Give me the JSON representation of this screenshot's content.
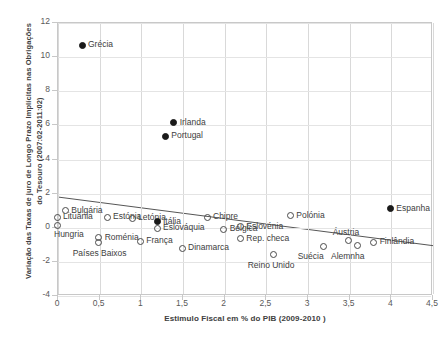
{
  "axes": {
    "y_title": "Variação das Taxas de juro de Longo Prazo Implícitas nas Obrigações do Tesouro  (2007:02-2011:02)",
    "x_title": "Estimulo Fiscal em % do PIB (2009-2010 )",
    "y_ticks": [
      "12",
      "10",
      "8",
      "6",
      "4",
      "2",
      "0",
      "-2",
      "-4"
    ],
    "x_ticks": [
      "0",
      "0,5",
      "1",
      "1,5",
      "2",
      "2,5",
      "3",
      "3,5",
      "4",
      "4,5"
    ]
  },
  "chart_data": {
    "type": "scatter",
    "title": "",
    "xlabel": "Estimulo Fiscal em % do PIB (2009-2010 )",
    "ylabel": "Variação das Taxas de juro de Longo Prazo Implícitas nas Obrigações do Tesouro  (2007:02-2011:02)",
    "xlim": [
      0,
      4.5
    ],
    "ylim": [
      -4,
      12
    ],
    "xtick_values": [
      0,
      0.5,
      1,
      1.5,
      2,
      2.5,
      3,
      3.5,
      4,
      4.5
    ],
    "ytick_values": [
      12,
      10,
      8,
      6,
      4,
      2,
      0,
      -2,
      -4
    ],
    "grid": "both",
    "legend": "none",
    "marker_styles": {
      "hollow": "outlined circle — non-programme countries",
      "filled": "solid black circle — bailout / stressed countries"
    },
    "trendline": {
      "visible": true,
      "x0": 0.0,
      "y0": 1.8,
      "x1": 4.5,
      "y1": -1.05
    },
    "points": [
      {
        "label": "Grécia",
        "x": 0.3,
        "y": 10.65,
        "style": "filled",
        "label_pos": "right"
      },
      {
        "label": "Irlanda",
        "x": 1.4,
        "y": 6.1,
        "style": "filled",
        "label_pos": "right"
      },
      {
        "label": "Portugal",
        "x": 1.3,
        "y": 5.3,
        "style": "filled",
        "label_pos": "right"
      },
      {
        "label": "Espanha",
        "x": 4.0,
        "y": 1.05,
        "style": "filled",
        "label_pos": "right"
      },
      {
        "label": "Lituânia",
        "x": 0.0,
        "y": 0.55,
        "style": "hollow",
        "label_pos": "right"
      },
      {
        "label": "Bulgária",
        "x": 0.1,
        "y": 0.95,
        "style": "hollow",
        "label_pos": "right"
      },
      {
        "label": "Hungria",
        "x": 0.0,
        "y": 0.1,
        "style": "hollow",
        "label_pos": "below-left"
      },
      {
        "label": "Estónia",
        "x": 0.6,
        "y": 0.55,
        "style": "hollow",
        "label_pos": "right"
      },
      {
        "label": "Roménia",
        "x": 0.5,
        "y": -0.65,
        "style": "hollow",
        "label_pos": "right"
      },
      {
        "label": "Países Baixos",
        "x": 0.5,
        "y": -0.95,
        "style": "hollow",
        "label_pos": "below"
      },
      {
        "label": "Letónia",
        "x": 0.9,
        "y": 0.5,
        "style": "hollow",
        "label_pos": "right"
      },
      {
        "label": "França",
        "x": 1.0,
        "y": -0.85,
        "style": "hollow",
        "label_pos": "right"
      },
      {
        "label": "Itália",
        "x": 1.2,
        "y": 0.3,
        "style": "filled",
        "label_pos": "right"
      },
      {
        "label": "Eslováquia",
        "x": 1.2,
        "y": -0.1,
        "style": "hollow",
        "label_pos": "right"
      },
      {
        "label": "Dinamarca",
        "x": 1.5,
        "y": -1.25,
        "style": "hollow",
        "label_pos": "right"
      },
      {
        "label": "Chipre",
        "x": 1.8,
        "y": 0.55,
        "style": "hollow",
        "label_pos": "right"
      },
      {
        "label": "Bélgica",
        "x": 2.0,
        "y": -0.15,
        "style": "hollow",
        "label_pos": "right"
      },
      {
        "label": "Eslovénia",
        "x": 2.2,
        "y": 0.0,
        "style": "hollow",
        "label_pos": "right"
      },
      {
        "label": "Rep. checa",
        "x": 2.2,
        "y": -0.7,
        "style": "hollow",
        "label_pos": "right"
      },
      {
        "label": "Reino Unido",
        "x": 2.6,
        "y": -1.65,
        "style": "hollow",
        "label_pos": "below"
      },
      {
        "label": "Polónia",
        "x": 2.8,
        "y": 0.65,
        "style": "hollow",
        "label_pos": "right"
      },
      {
        "label": "Suécia",
        "x": 3.2,
        "y": -1.15,
        "style": "hollow",
        "label_pos": "below"
      },
      {
        "label": "Áustria",
        "x": 3.5,
        "y": -0.8,
        "style": "hollow",
        "label_pos": "above"
      },
      {
        "label": "Alemnha",
        "x": 3.6,
        "y": -1.1,
        "style": "hollow",
        "label_pos": "below"
      },
      {
        "label": "Finlândia",
        "x": 3.8,
        "y": -0.9,
        "style": "hollow",
        "label_pos": "right"
      }
    ]
  }
}
